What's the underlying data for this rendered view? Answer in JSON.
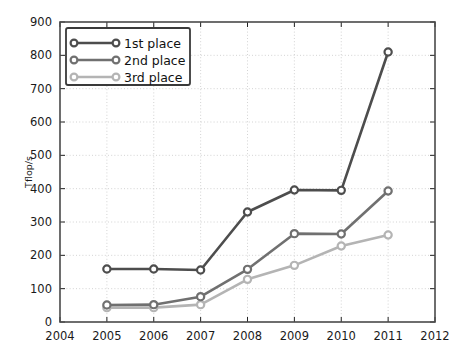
{
  "chart_data": {
    "type": "line",
    "title": "",
    "xlabel": "",
    "ylabel": "Tflop/s",
    "x": [
      2005,
      2006,
      2007,
      2008,
      2009,
      2010,
      2011
    ],
    "xlim": [
      2004,
      2012
    ],
    "ylim": [
      0,
      900
    ],
    "xticks": [
      "2004",
      "2005",
      "2006",
      "2007",
      "2008",
      "2009",
      "2010",
      "2011",
      "2012"
    ],
    "yticks": [
      "0",
      "100",
      "200",
      "300",
      "400",
      "500",
      "600",
      "700",
      "800",
      "900"
    ],
    "grid": true,
    "legend_position": "upper left",
    "series": [
      {
        "name": "1st place",
        "color": "#4d4d4d",
        "values": [
          159,
          159,
          156,
          330,
          396,
          395,
          810
        ]
      },
      {
        "name": "2nd place",
        "color": "#707070",
        "values": [
          51,
          52,
          76,
          158,
          265,
          264,
          393
        ]
      },
      {
        "name": "3rd place",
        "color": "#b4b4b4",
        "values": [
          43,
          43,
          52,
          128,
          170,
          228,
          261
        ]
      }
    ]
  },
  "legend": {
    "entries": [
      {
        "label": "1st place"
      },
      {
        "label": "2nd place"
      },
      {
        "label": "3rd place"
      }
    ]
  },
  "axes": {
    "y_axis_title": "Tflop/s"
  }
}
